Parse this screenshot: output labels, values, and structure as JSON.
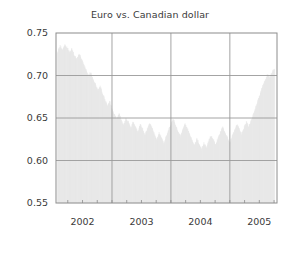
{
  "chart_data": {
    "type": "area",
    "title": "Euro vs. Canadian dollar",
    "xlabel": "",
    "ylabel": "",
    "grid": true,
    "legend": null,
    "ylim": [
      0.55,
      0.75
    ],
    "xlim": [
      2001.55,
      2005.3
    ],
    "yticks": [
      "0.75",
      "0.70",
      "0.65",
      "0.60",
      "0.55"
    ],
    "ytick_values": [
      0.75,
      0.7,
      0.65,
      0.6,
      0.55
    ],
    "xticks": [
      "2002",
      "2003",
      "2004",
      "2005"
    ],
    "xtick_values": [
      2002,
      2003,
      2004,
      2005
    ],
    "minor_xticks_per_year": 4,
    "fill_color": "#e8e8e8",
    "grid_color": "#9a9a9a",
    "axis_color": "#8c8c8c",
    "text_color": "#3a3a3a",
    "series_name": "EUR/CAD",
    "x": [
      2001.58,
      2001.62,
      2001.66,
      2001.7,
      2001.74,
      2001.78,
      2001.82,
      2001.86,
      2001.9,
      2001.94,
      2001.98,
      2002.02,
      2002.06,
      2002.1,
      2002.14,
      2002.18,
      2002.22,
      2002.26,
      2002.3,
      2002.34,
      2002.38,
      2002.42,
      2002.46,
      2002.5,
      2002.54,
      2002.58,
      2002.62,
      2002.66,
      2002.7,
      2002.74,
      2002.78,
      2002.82,
      2002.86,
      2002.9,
      2002.94,
      2002.98,
      2003.02,
      2003.06,
      2003.1,
      2003.14,
      2003.18,
      2003.22,
      2003.26,
      2003.3,
      2003.34,
      2003.38,
      2003.42,
      2003.46,
      2003.5,
      2003.54,
      2003.58,
      2003.62,
      2003.66,
      2003.7,
      2003.74,
      2003.78,
      2003.82,
      2003.86,
      2003.9,
      2003.94,
      2003.98,
      2004.02,
      2004.06,
      2004.1,
      2004.14,
      2004.18,
      2004.22,
      2004.26,
      2004.3,
      2004.34,
      2004.38,
      2004.42,
      2004.46,
      2004.5,
      2004.54,
      2004.58,
      2004.62,
      2004.66,
      2004.7,
      2004.74,
      2004.78,
      2004.82,
      2004.86,
      2004.9,
      2004.94,
      2004.98,
      2005.02,
      2005.06,
      2005.1,
      2005.14,
      2005.18,
      2005.22,
      2005.26
    ],
    "y": [
      0.727,
      0.733,
      0.729,
      0.735,
      0.731,
      0.726,
      0.73,
      0.722,
      0.718,
      0.724,
      0.719,
      0.712,
      0.705,
      0.698,
      0.702,
      0.694,
      0.688,
      0.681,
      0.686,
      0.677,
      0.67,
      0.663,
      0.668,
      0.659,
      0.652,
      0.648,
      0.654,
      0.645,
      0.64,
      0.648,
      0.643,
      0.636,
      0.644,
      0.638,
      0.632,
      0.641,
      0.635,
      0.628,
      0.636,
      0.643,
      0.637,
      0.629,
      0.622,
      0.631,
      0.626,
      0.618,
      0.627,
      0.634,
      0.641,
      0.648,
      0.64,
      0.633,
      0.627,
      0.635,
      0.642,
      0.636,
      0.629,
      0.622,
      0.616,
      0.624,
      0.618,
      0.612,
      0.619,
      0.614,
      0.621,
      0.628,
      0.623,
      0.617,
      0.625,
      0.632,
      0.638,
      0.631,
      0.625,
      0.619,
      0.627,
      0.634,
      0.641,
      0.636,
      0.629,
      0.637,
      0.644,
      0.638,
      0.645,
      0.653,
      0.661,
      0.67,
      0.678,
      0.687,
      0.693,
      0.7,
      0.696,
      0.703,
      0.707
    ]
  },
  "layout": {
    "plot_left": 56,
    "plot_top": 33,
    "plot_right": 277,
    "plot_bottom": 203
  }
}
